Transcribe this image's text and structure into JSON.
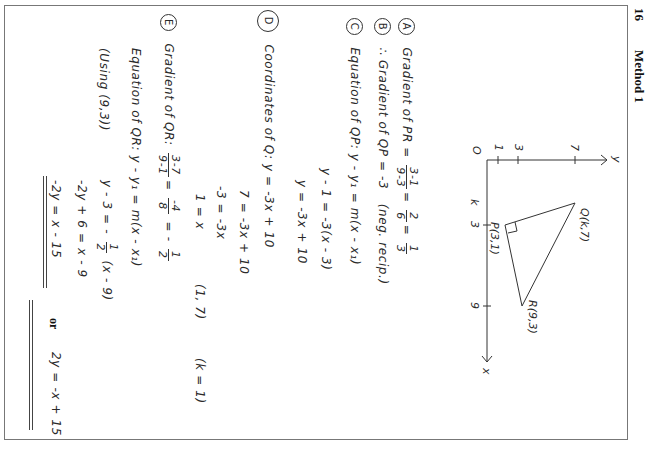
{
  "header": {
    "page_number": "16",
    "section_title": "Method 1"
  },
  "diagram": {
    "origin_label": "O",
    "x_axis_label": "x",
    "y_axis_label": "y",
    "y_ticks": [
      "1",
      "3",
      "7"
    ],
    "x_ticks": [
      "3",
      "9"
    ],
    "k_label": "k",
    "points": {
      "P": "P(3,1)",
      "Q": "Q(k,7)",
      "R": "R(9,3)"
    },
    "right_angle_at": "P"
  },
  "parts": {
    "A": {
      "marker": "A",
      "text": "Gradient of PR =",
      "frac1_num": "3-1",
      "frac1_den": "9-3",
      "frac2_num": "2",
      "frac2_den": "6",
      "frac3_num": "1",
      "frac3_den": "3"
    },
    "B": {
      "marker": "B",
      "text": "∴ Gradient of QP = -3",
      "note": "(neg. recip.)"
    },
    "C": {
      "marker": "C",
      "text": "Equation of QP:  y - y₁ = m(x - x₁)",
      "line2": "y - 1 = -3(x - 3)",
      "line3": "y = -3x + 10"
    },
    "D": {
      "marker": "D",
      "text": "Coordinates of Q:  y = -3x + 10",
      "line2": "7 = -3x + 10",
      "line3": "-3 = -3x",
      "line4": "1 = x",
      "result": "(1, 7)",
      "k_value": "(k = 1)"
    },
    "E": {
      "marker": "E",
      "text": "Gradient of QR:",
      "frac1_num": "3-7",
      "frac1_den": "9-1",
      "frac2_num": "-4",
      "frac2_den": "8",
      "result_prefix": "= -",
      "frac3_num": "1",
      "frac3_den": "2",
      "eq_label": "Equation of QR:  y - y₁ = m(x - x₁)",
      "using": "(Using (9,3))",
      "line2_prefix": "y - 3 = -",
      "line2_frac_num": "1",
      "line2_frac_den": "2",
      "line2_suffix": "(x - 9)",
      "line3": "-2y + 6 = x - 9",
      "line4": "-2y = x - 15",
      "or": "or",
      "alt": "2y = -x + 15"
    }
  }
}
